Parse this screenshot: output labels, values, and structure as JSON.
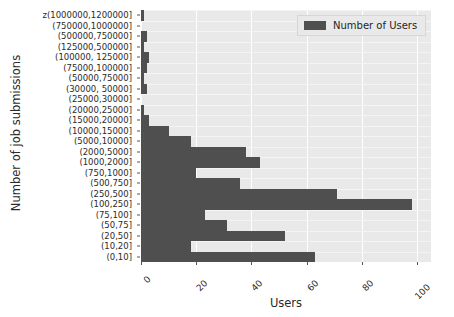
{
  "chart_data": {
    "type": "bar",
    "orientation": "horizontal",
    "title": "",
    "xlabel": "Users",
    "ylabel": "Number of job submissions",
    "xlim": [
      0,
      105
    ],
    "xticks": [
      0,
      20,
      40,
      60,
      80,
      100
    ],
    "xtick_labels": [
      "0",
      "20",
      "40",
      "60",
      "80",
      "100"
    ],
    "grid": true,
    "legend": {
      "position": "upper right",
      "entries": [
        {
          "name": "Number of Users",
          "color": "#4f4f4f"
        }
      ]
    },
    "series_name": "Number of Users",
    "categories": [
      "z(1000000,1200000]",
      "(750000,1000000]",
      "(500000,750000]",
      "(125000,500000]",
      "(100000, 125000]",
      "(75000,100000]",
      "(50000,75000]",
      "(30000, 50000]",
      "(25000,30000]",
      "(20000,25000]",
      "(15000,20000]",
      "(10000,15000]",
      "(5000,10000]",
      "(2000,5000]",
      "(1000,2000]",
      "(750,1000]",
      "(500,750]",
      "(250,500]",
      "(100,250]",
      "(75,100]",
      "(50,75]",
      "(20,50]",
      "(10,20]",
      "(0,10]"
    ],
    "values": [
      1,
      0,
      2,
      1,
      3,
      2,
      1,
      2,
      0,
      1,
      3,
      10,
      18,
      38,
      43,
      20,
      36,
      71,
      98,
      23,
      31,
      52,
      18,
      63
    ]
  },
  "colors": {
    "bar": "#4f4f4f",
    "plot_background": "#e9e9e9",
    "grid": "#ffffff",
    "figure_background": "#ffffff",
    "text": "#2b2b2b"
  }
}
